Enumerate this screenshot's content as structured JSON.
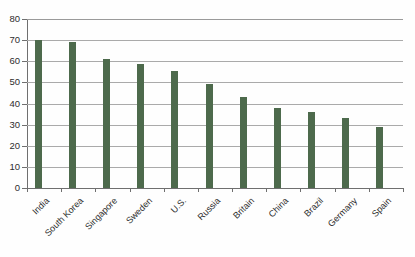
{
  "chart_data": {
    "type": "bar",
    "title": "",
    "subtitle": "",
    "xlabel": "",
    "ylabel": "",
    "ylim": [
      0,
      80
    ],
    "ytick_labels": [
      "0",
      "10",
      "20",
      "30",
      "40",
      "50",
      "60",
      "70",
      "80"
    ],
    "ytick_values": [
      0,
      10,
      20,
      30,
      40,
      50,
      60,
      70,
      80
    ],
    "grid": "horizontal",
    "legend": "none",
    "bar_color": "#4d6a4c",
    "categories": [
      "India",
      "South Korea",
      "Singapore",
      "Sweden",
      "U.S.",
      "Russia",
      "Britain",
      "China",
      "Brazil",
      "Germany",
      "Spain"
    ],
    "values": [
      70,
      69,
      61,
      58.5,
      55.5,
      49,
      43,
      38,
      36,
      33,
      29
    ]
  },
  "colors": {
    "bar": "#4d6a4c",
    "gridline": "#aaaaaa",
    "axis": "#6f6f6f",
    "text": "#2d2d2d",
    "background": "#fefefe"
  }
}
